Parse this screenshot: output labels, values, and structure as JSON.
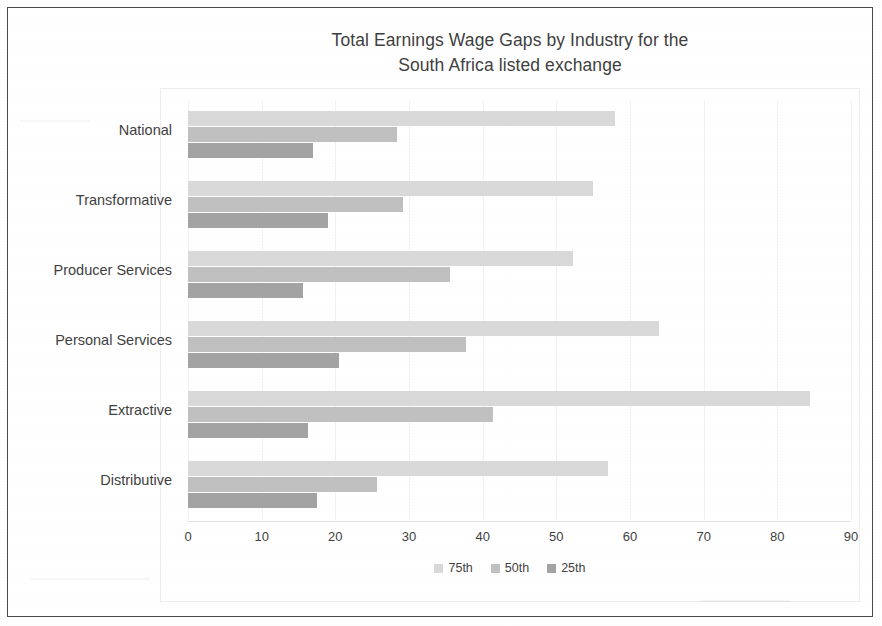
{
  "title": {
    "line1": "Total Earnings Wage Gaps by Industry for the",
    "line2": "South Africa listed exchange"
  },
  "legend": [
    {
      "label": "75th",
      "color": "#d9d9d9"
    },
    {
      "label": "50th",
      "color": "#c0c0c0"
    },
    {
      "label": "25th",
      "color": "#a3a3a3"
    }
  ],
  "axis": {
    "ticks": [
      "0",
      "10",
      "20",
      "30",
      "40",
      "50",
      "60",
      "70",
      "80",
      "90"
    ]
  },
  "categories": [
    "National",
    "Transformative",
    "Producer Services",
    "Personal Services",
    "Extractive",
    "Distributive"
  ],
  "chart_data": {
    "type": "bar",
    "orientation": "horizontal",
    "title": "Total Earnings Wage Gaps by Industry for the South Africa listed exchange",
    "xlabel": "",
    "ylabel": "",
    "xlim": [
      0,
      90
    ],
    "xticks": [
      0,
      10,
      20,
      30,
      40,
      50,
      60,
      70,
      80,
      90
    ],
    "grid": true,
    "legend_position": "bottom",
    "categories": [
      "National",
      "Transformative",
      "Producer Services",
      "Personal Services",
      "Extractive",
      "Distributive"
    ],
    "series": [
      {
        "name": "75th",
        "color": "#d9d9d9",
        "values": [
          58.0,
          55.0,
          52.3,
          64.0,
          84.5,
          57.0
        ]
      },
      {
        "name": "50th",
        "color": "#c0c0c0",
        "values": [
          28.4,
          29.2,
          35.5,
          37.8,
          41.4,
          25.6
        ]
      },
      {
        "name": "25th",
        "color": "#a3a3a3",
        "values": [
          17.0,
          19.0,
          15.6,
          20.5,
          16.3,
          17.5
        ]
      }
    ]
  }
}
